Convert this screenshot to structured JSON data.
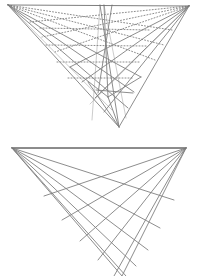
{
  "page": {
    "background_color": "#ffffff",
    "width": 198,
    "height": 276
  },
  "style": {
    "line_color": "#808080",
    "line_color_light": "#b8b8b8",
    "line_color_dark": "#6e6e6e",
    "stroke_width": 0.9,
    "dot_dash_pattern": "1,2"
  },
  "chart_data": {
    "type": "diagram",
    "figures": [
      {
        "name": "upper-figure",
        "label": "Upper figure: mixed solid and dotted pencil of lines",
        "left_apex": [
          8,
          5
        ],
        "right_apex": [
          189,
          6
        ],
        "bottom_vertex": [
          119,
          127
        ],
        "inner_node": [
          108,
          97
        ],
        "top_edge": [
          [
            8,
            5
          ],
          [
            189,
            6
          ]
        ],
        "solid_lines": [
          [
            [
              8,
              5
            ],
            [
              119,
              127
            ]
          ],
          [
            [
              8,
              5
            ],
            [
              128,
              108
            ]
          ],
          [
            [
              8,
              5
            ],
            [
              134,
              92
            ]
          ],
          [
            [
              8,
              5
            ],
            [
              141,
              77
            ]
          ],
          [
            [
              189,
              6
            ],
            [
              119,
              127
            ]
          ],
          [
            [
              189,
              6
            ],
            [
              104,
              112
            ]
          ],
          [
            [
              189,
              6
            ],
            [
              95,
              98
            ]
          ],
          [
            [
              189,
              6
            ],
            [
              82,
              82
            ]
          ],
          [
            [
              189,
              6
            ],
            [
              70,
              67
            ]
          ],
          [
            [
              100,
              5
            ],
            [
              119,
              127
            ]
          ],
          [
            [
              104,
              5
            ],
            [
              108,
              97
            ]
          ],
          [
            [
              112,
              5
            ],
            [
              98,
              93
            ]
          ],
          [
            [
              108,
              97
            ],
            [
              119,
              127
            ]
          ],
          [
            [
              96,
              90
            ],
            [
              133,
              93
            ]
          ],
          [
            [
              88,
              82
            ],
            [
              119,
              127
            ]
          ],
          [
            [
              108,
              97
            ],
            [
              141,
              77
            ]
          ],
          [
            [
              108,
              97
            ],
            [
              70,
              67
            ]
          ]
        ],
        "dotted_lines": [
          [
            [
              8,
              5
            ],
            [
              155,
              60
            ]
          ],
          [
            [
              8,
              5
            ],
            [
              164,
              45
            ]
          ],
          [
            [
              8,
              5
            ],
            [
              172,
              30
            ]
          ],
          [
            [
              189,
              6
            ],
            [
              55,
              52
            ]
          ],
          [
            [
              189,
              6
            ],
            [
              42,
              37
            ]
          ],
          [
            [
              189,
              6
            ],
            [
              30,
              22
            ]
          ],
          [
            [
              40,
              28
            ],
            [
              150,
              30
            ]
          ],
          [
            [
              46,
              45
            ],
            [
              146,
              46
            ]
          ],
          [
            [
              57,
              62
            ],
            [
              140,
              62
            ]
          ],
          [
            [
              68,
              78
            ],
            [
              133,
              78
            ]
          ]
        ],
        "faint_lines": [
          [
            [
              8,
              5
            ],
            [
              112,
              110
            ]
          ],
          [
            [
              189,
              6
            ],
            [
              90,
              104
            ]
          ],
          [
            [
              100,
              5
            ],
            [
              92,
              120
            ]
          ],
          [
            [
              104,
              5
            ],
            [
              126,
              118
            ]
          ]
        ]
      },
      {
        "name": "lower-figure",
        "label": "Lower figure: clean fan-and-grid pencil of lines",
        "left_apex": [
          12,
          148
        ],
        "right_apex": [
          186,
          148
        ],
        "bottom_vertex": [
          122,
          276
        ],
        "top_edge": [
          [
            12,
            148
          ],
          [
            186,
            148
          ]
        ],
        "left_fan_endpoints": [
          [
            186,
            148
          ],
          [
            174,
            200
          ],
          [
            160,
            228
          ],
          [
            148,
            250
          ],
          [
            136,
            266
          ],
          [
            126,
            276
          ],
          [
            122,
            276
          ]
        ],
        "right_fan_endpoints": [
          [
            12,
            148
          ],
          [
            44,
            196
          ],
          [
            62,
            220
          ],
          [
            80,
            241
          ],
          [
            98,
            260
          ],
          [
            114,
            276
          ],
          [
            122,
            276
          ]
        ],
        "left_fan_count": 6,
        "right_fan_count": 6
      }
    ]
  }
}
